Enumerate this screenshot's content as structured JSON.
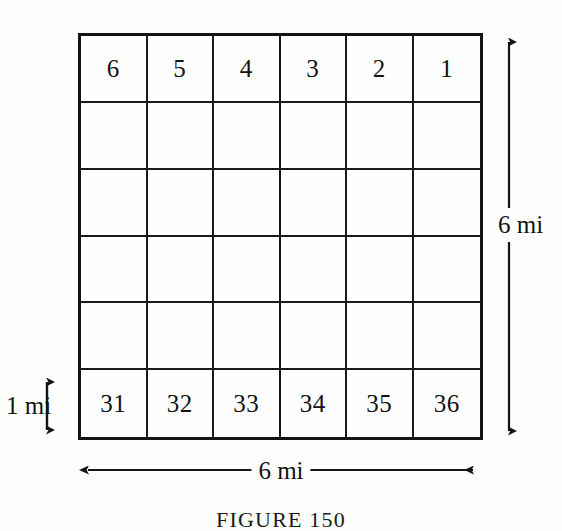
{
  "figure": {
    "caption": "FIGURE 150",
    "background_color": "#fdfdfb",
    "ink_color": "#121212"
  },
  "grid": {
    "rows": 6,
    "columns": 6,
    "cells": [
      [
        "6",
        "5",
        "4",
        "3",
        "2",
        "1"
      ],
      [
        "",
        "",
        "",
        "",
        "",
        ""
      ],
      [
        "",
        "",
        "",
        "",
        "",
        ""
      ],
      [
        "",
        "",
        "",
        "",
        "",
        ""
      ],
      [
        "",
        "",
        "",
        "",
        "",
        ""
      ],
      [
        "31",
        "32",
        "33",
        "34",
        "35",
        "36"
      ]
    ]
  },
  "dimensions": {
    "height_label": "6 mi",
    "width_label": "6 mi",
    "unit_cell_label": "1 mi"
  },
  "icons": {
    "height_arrow": "double-headed-vertical-arrow",
    "width_arrow": "double-headed-horizontal-arrow",
    "unit_arrow": "double-headed-vertical-arrow-small"
  },
  "chart_data": {
    "type": "table",
    "title": "FIGURE 150",
    "rows": 6,
    "columns": 6,
    "categories": [
      "col1",
      "col2",
      "col3",
      "col4",
      "col5",
      "col6"
    ],
    "values": [
      [
        6,
        5,
        4,
        3,
        2,
        1
      ],
      [
        null,
        null,
        null,
        null,
        null,
        null
      ],
      [
        null,
        null,
        null,
        null,
        null,
        null
      ],
      [
        null,
        null,
        null,
        null,
        null,
        null
      ],
      [
        null,
        null,
        null,
        null,
        null,
        null
      ],
      [
        31,
        32,
        33,
        34,
        35,
        36
      ]
    ],
    "annotations": [
      "6 mi",
      "6 mi",
      "1 mi"
    ],
    "xlabel": "6 mi",
    "ylabel": "6 mi",
    "grid": true,
    "legend": "none"
  }
}
